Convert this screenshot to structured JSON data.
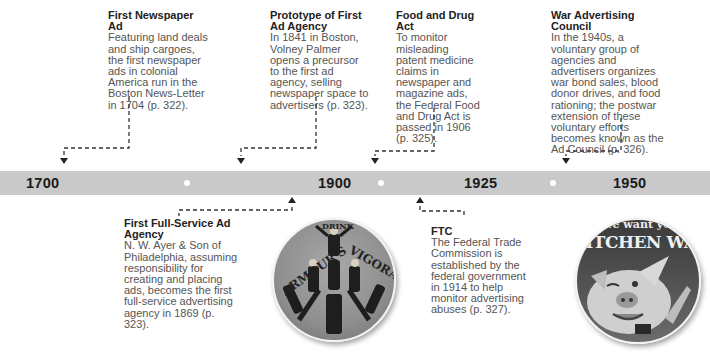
{
  "timeline": {
    "years": [
      {
        "label": "1700",
        "x": 26
      },
      {
        "label": "1900",
        "x": 318
      },
      {
        "label": "1925",
        "x": 464
      },
      {
        "label": "1950",
        "x": 613
      }
    ],
    "band_color": "#c9c9c9",
    "dot_positions": [
      187,
      381,
      553
    ]
  },
  "events_above": [
    {
      "title": "First Newspaper Ad",
      "description": "Featuring land deals and ship cargoes, the first newspaper ads in colonial America run in the Boston News-Letter in 1704 (p. 322)."
    },
    {
      "title": "Prototype of First Ad Agency",
      "description": "In 1841 in Boston, Volney Palmer opens a precursor to the first ad agency, selling newspaper space to advertisers (p. 323)."
    },
    {
      "title": "Food and Drug Act",
      "description": "To monitor misleading patent medicine claims in newspaper and magazine ads, the Federal Food and Drug Act is passed in 1906 (p. 325)."
    },
    {
      "title": "War Advertising Council",
      "description": "In the 1940s, a voluntary group of agencies and advertisers organizes war bond sales, blood donor drives, and food rationing; the postwar extension of these voluntary efforts becomes known as the Ad Council (p. 326)."
    }
  ],
  "events_below": [
    {
      "title": "First Full-Service Ad Agency",
      "description": "N. W. Ayer & Son of Philadelphia, assuming responsibility for creating and placing ads, becomes the first full-service advertising agency in 1869 (p. 323)."
    },
    {
      "title": "FTC",
      "description": "The Federal Trade Commission is established by the federal government in 1914 to help monitor advertising abuses (p. 327)."
    }
  ],
  "images": [
    {
      "name": "armours-vigoral-ad",
      "text_top": "DRINK",
      "text_left": "ARMOUR'S",
      "text_right": "VIGORAL"
    },
    {
      "name": "kitchen-waste-poster",
      "text_top": "We want your",
      "text_main": "KITCHEN WASTE"
    }
  ]
}
